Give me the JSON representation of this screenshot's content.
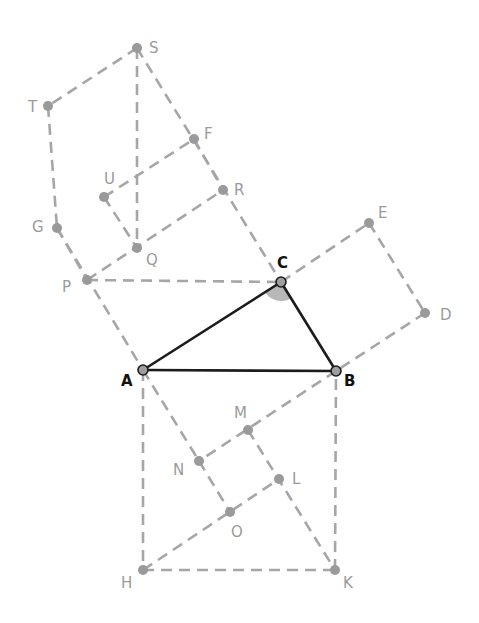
{
  "diagram": {
    "colors": {
      "main": "#1c1c1c",
      "auxiliary": "#a6a6a6",
      "angle_fill": "#b8b8b8"
    },
    "triangle": [
      "A",
      "B",
      "C"
    ],
    "right_angle_at": "C",
    "points": {
      "S": {
        "x": 137,
        "y": 48,
        "label": "S",
        "style": "aux",
        "lx": 149,
        "ly": 53
      },
      "T": {
        "x": 48,
        "y": 106,
        "label": "T",
        "style": "aux",
        "lx": 28,
        "ly": 112
      },
      "F": {
        "x": 194,
        "y": 139,
        "label": "F",
        "style": "aux",
        "lx": 204,
        "ly": 139
      },
      "U": {
        "x": 104,
        "y": 197,
        "label": "U",
        "style": "aux",
        "lx": 104,
        "ly": 184
      },
      "R": {
        "x": 223,
        "y": 190,
        "label": "R",
        "style": "aux",
        "lx": 234,
        "ly": 195
      },
      "G": {
        "x": 57,
        "y": 228,
        "label": "G",
        "style": "aux",
        "lx": 32,
        "ly": 232
      },
      "Q": {
        "x": 137,
        "y": 248,
        "label": "Q",
        "style": "aux",
        "lx": 146,
        "ly": 265
      },
      "P": {
        "x": 87,
        "y": 280,
        "label": "P",
        "style": "aux",
        "lx": 62,
        "ly": 292
      },
      "E": {
        "x": 369,
        "y": 223,
        "label": "E",
        "style": "aux",
        "lx": 378,
        "ly": 218
      },
      "D": {
        "x": 425,
        "y": 313,
        "label": "D",
        "style": "aux",
        "lx": 440,
        "ly": 320
      },
      "M": {
        "x": 248,
        "y": 430,
        "label": "M",
        "style": "aux",
        "lx": 234,
        "ly": 418
      },
      "N": {
        "x": 199,
        "y": 461,
        "label": "N",
        "style": "aux",
        "lx": 173,
        "ly": 475
      },
      "L": {
        "x": 279,
        "y": 479,
        "label": "L",
        "style": "aux",
        "lx": 292,
        "ly": 484
      },
      "O": {
        "x": 230,
        "y": 512,
        "label": "O",
        "style": "aux",
        "lx": 231,
        "ly": 537
      },
      "H": {
        "x": 143,
        "y": 570,
        "label": "H",
        "style": "aux",
        "lx": 121,
        "ly": 588
      },
      "K": {
        "x": 335,
        "y": 570,
        "label": "K",
        "style": "aux",
        "lx": 343,
        "ly": 588
      },
      "A": {
        "x": 143,
        "y": 370,
        "label": "A",
        "style": "main",
        "lx": 121,
        "ly": 386
      },
      "B": {
        "x": 336,
        "y": 371,
        "label": "B",
        "style": "main",
        "lx": 344,
        "ly": 386
      },
      "C": {
        "x": 281,
        "y": 282,
        "label": "C",
        "style": "main",
        "lx": 277,
        "ly": 268
      }
    },
    "main_segments": [
      [
        "A",
        "B"
      ],
      [
        "B",
        "C"
      ],
      [
        "C",
        "A"
      ]
    ],
    "aux_segments": [
      [
        "S",
        "T"
      ],
      [
        "T",
        "G"
      ],
      [
        "S",
        "C"
      ],
      [
        "G",
        "A"
      ],
      [
        "S",
        "Q"
      ],
      [
        "U",
        "F"
      ],
      [
        "P",
        "R"
      ],
      [
        "G",
        "P"
      ],
      [
        "U",
        "Q"
      ],
      [
        "F",
        "R"
      ],
      [
        "P",
        "C"
      ],
      [
        "C",
        "E"
      ],
      [
        "E",
        "D"
      ],
      [
        "D",
        "B"
      ],
      [
        "A",
        "H"
      ],
      [
        "H",
        "K"
      ],
      [
        "K",
        "B"
      ],
      [
        "B",
        "N"
      ],
      [
        "H",
        "L"
      ],
      [
        "N",
        "O"
      ],
      [
        "M",
        "K"
      ],
      [
        "A",
        "N"
      ]
    ]
  }
}
